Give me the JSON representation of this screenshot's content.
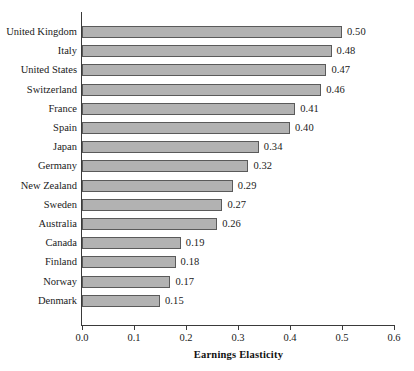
{
  "chart_data": {
    "type": "bar",
    "orientation": "horizontal",
    "title": "",
    "xlabel": "Earnings Elasticity",
    "ylabel": "",
    "xlim": [
      0.0,
      0.6
    ],
    "xticks": [
      "0.0",
      "0.1",
      "0.2",
      "0.3",
      "0.4",
      "0.5",
      "0.6"
    ],
    "xtick_values": [
      0.0,
      0.1,
      0.2,
      0.3,
      0.4,
      0.5,
      0.6
    ],
    "grid": false,
    "legend": null,
    "categories": [
      "United Kingdom",
      "Italy",
      "United States",
      "Switzerland",
      "France",
      "Spain",
      "Japan",
      "Germany",
      "New Zealand",
      "Sweden",
      "Australia",
      "Canada",
      "Finland",
      "Norway",
      "Denmark"
    ],
    "values": [
      0.5,
      0.48,
      0.47,
      0.46,
      0.41,
      0.4,
      0.34,
      0.32,
      0.29,
      0.27,
      0.26,
      0.19,
      0.18,
      0.17,
      0.15
    ],
    "value_labels": [
      "0.50",
      "0.48",
      "0.47",
      "0.46",
      "0.41",
      "0.40",
      "0.34",
      "0.32",
      "0.29",
      "0.27",
      "0.26",
      "0.19",
      "0.18",
      "0.17",
      "0.15"
    ],
    "bar_fill_color": "#b2b2b2",
    "bar_edge_color": "#5a5a5a",
    "axis_color": "#3a3a3a",
    "background_color": "#ffffff"
  }
}
